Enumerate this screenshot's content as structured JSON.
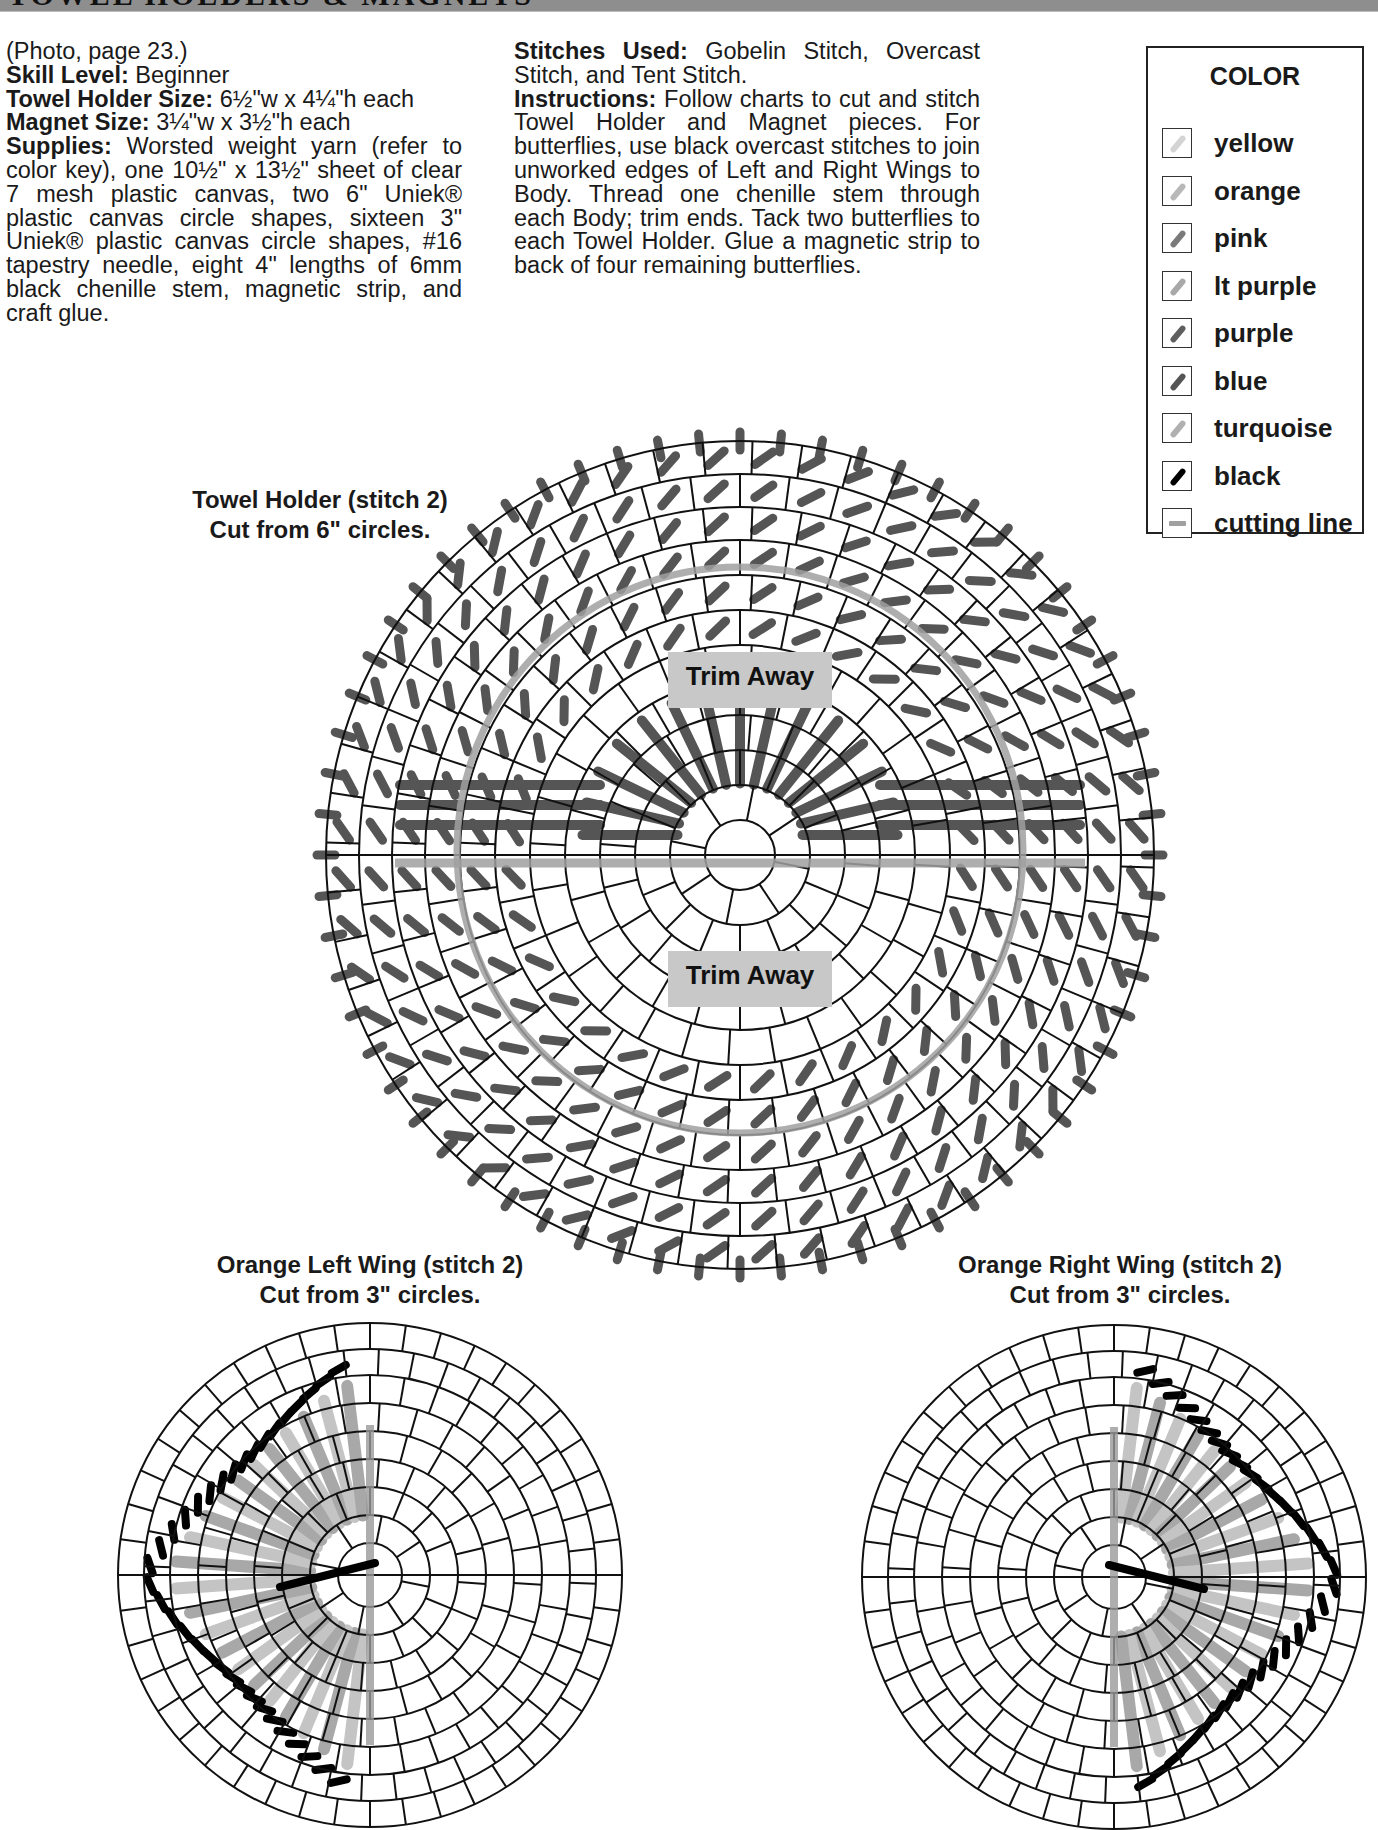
{
  "header": {
    "title": "TOWEL HOLDERS & MAGNETS"
  },
  "intro": {
    "photo_ref": "(Photo, page 23.)",
    "skill_level_label": "Skill Level:",
    "skill_level_value": " Beginner",
    "towel_holder_size_label": "Towel Holder Size:",
    "towel_holder_size_value": " 6½\"w x 4¼\"h each",
    "magnet_size_label": "Magnet Size:",
    "magnet_size_value": " 3¼\"w x 3½\"h each",
    "supplies_label": "Supplies:",
    "supplies_value": " Worsted weight yarn (refer to color key), one 10½\" x 13½\" sheet of clear 7 mesh plastic canvas, two 6\" Uniek® plastic canvas circle shapes, sixteen 3\" Uniek® plastic canvas circle shapes, #16 tapestry needle, eight 4\" lengths of 6mm black chenille stem, magnetic strip, and craft glue."
  },
  "instructions": {
    "stitches_label": "Stitches Used:",
    "stitches_value": " Gobelin Stitch, Overcast Stitch, and Tent Stitch.",
    "instructions_label": "Instructions:",
    "instructions_value": " Follow charts to cut and stitch Towel Holder and Magnet pieces. For butterflies, use black overcast stitches to join unworked edges of Left and Right Wings to Body. Thread one chenille stem through each Body; trim ends. Tack two butterflies to each Towel Holder. Glue a magnetic strip to back of four remaining butterflies."
  },
  "legend": {
    "title": "COLOR",
    "items": [
      {
        "label": "yellow",
        "color": "#d4d4d4",
        "icon": "diagonal-stitch-icon"
      },
      {
        "label": "orange",
        "color": "#b8b8b8",
        "icon": "diagonal-stitch-icon"
      },
      {
        "label": "pink",
        "color": "#7a7a7a",
        "icon": "diagonal-stitch-icon"
      },
      {
        "label": "lt purple",
        "color": "#a8a8a8",
        "icon": "diagonal-stitch-icon"
      },
      {
        "label": "purple",
        "color": "#5e5e5e",
        "icon": "diagonal-stitch-icon"
      },
      {
        "label": "blue",
        "color": "#555555",
        "icon": "diagonal-stitch-icon"
      },
      {
        "label": "turquoise",
        "color": "#b0b0b0",
        "icon": "diagonal-stitch-icon"
      },
      {
        "label": "black",
        "color": "#000000",
        "icon": "diagonal-stitch-icon"
      },
      {
        "label": "cutting line",
        "color": "#a0a0a0",
        "icon": "cutting-line-icon"
      }
    ]
  },
  "charts": {
    "towel_holder": {
      "caption_line1": "Towel Holder (stitch 2)",
      "caption_line2": "Cut from 6\" circles.",
      "trim_top": "Trim Away",
      "trim_bottom": "Trim Away",
      "stitch_color": "#555555",
      "cut_color": "#a0a0a0"
    },
    "left_wing": {
      "caption_line1": "Orange Left Wing (stitch 2)",
      "caption_line2": "Cut from 3\" circles."
    },
    "right_wing": {
      "caption_line1": "Orange Right Wing (stitch 2)",
      "caption_line2": "Cut from 3\" circles."
    }
  }
}
